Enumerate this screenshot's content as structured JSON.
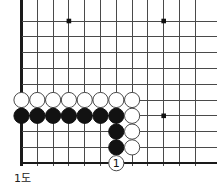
{
  "figure": {
    "caption": "1도",
    "kind": "go-board-diagram"
  },
  "board": {
    "geometry": {
      "origin_x": 21.5,
      "origin_y": 21.0,
      "spacing": 15.8,
      "cols_visible": 12,
      "rows_visible": 10,
      "stone_radius": 7.6,
      "line_color": "#4a4a4a",
      "border_color": "#1a1a1a",
      "line_width": 1,
      "border_width": 2.2,
      "clip_right": 217,
      "clip_bottom": 166
    },
    "star_points": [
      {
        "name": "star-point-top-left",
        "col": 3,
        "row": 0
      },
      {
        "name": "star-point-top-right",
        "col": 9,
        "row": 0
      },
      {
        "name": "star-point-right-center",
        "col": 9,
        "row": 6
      }
    ],
    "edges": {
      "left_edge_col": 0,
      "bottom_edge_row": 9
    },
    "stones": [
      {
        "id": "w-c0-r5",
        "color": "white",
        "col": 0,
        "row": 5,
        "label": ""
      },
      {
        "id": "w-c1-r5",
        "color": "white",
        "col": 1,
        "row": 5,
        "label": ""
      },
      {
        "id": "w-c2-r5",
        "color": "white",
        "col": 2,
        "row": 5,
        "label": ""
      },
      {
        "id": "w-c3-r5",
        "color": "white",
        "col": 3,
        "row": 5,
        "label": ""
      },
      {
        "id": "w-c4-r5",
        "color": "white",
        "col": 4,
        "row": 5,
        "label": ""
      },
      {
        "id": "w-c5-r5",
        "color": "white",
        "col": 5,
        "row": 5,
        "label": ""
      },
      {
        "id": "w-c6-r5",
        "color": "white",
        "col": 6,
        "row": 5,
        "label": ""
      },
      {
        "id": "w-c7-r5",
        "color": "white",
        "col": 7,
        "row": 5,
        "label": ""
      },
      {
        "id": "b-c0-r6",
        "color": "black",
        "col": 0,
        "row": 6,
        "label": ""
      },
      {
        "id": "b-c1-r6",
        "color": "black",
        "col": 1,
        "row": 6,
        "label": ""
      },
      {
        "id": "b-c2-r6",
        "color": "black",
        "col": 2,
        "row": 6,
        "label": ""
      },
      {
        "id": "b-c3-r6",
        "color": "black",
        "col": 3,
        "row": 6,
        "label": ""
      },
      {
        "id": "b-c4-r6",
        "color": "black",
        "col": 4,
        "row": 6,
        "label": ""
      },
      {
        "id": "b-c5-r6",
        "color": "black",
        "col": 5,
        "row": 6,
        "label": ""
      },
      {
        "id": "b-c6-r6",
        "color": "black",
        "col": 6,
        "row": 6,
        "label": ""
      },
      {
        "id": "w-c7-r6",
        "color": "white",
        "col": 7,
        "row": 6,
        "label": ""
      },
      {
        "id": "b-c6-r7",
        "color": "black",
        "col": 6,
        "row": 7,
        "label": ""
      },
      {
        "id": "w-c7-r7",
        "color": "white",
        "col": 7,
        "row": 7,
        "label": ""
      },
      {
        "id": "b-c6-r8",
        "color": "black",
        "col": 6,
        "row": 8,
        "label": ""
      },
      {
        "id": "w-c7-r8",
        "color": "white",
        "col": 7,
        "row": 8,
        "label": ""
      },
      {
        "id": "w-c6-r9-move1",
        "color": "white",
        "col": 6,
        "row": 9,
        "label": "1"
      }
    ]
  }
}
